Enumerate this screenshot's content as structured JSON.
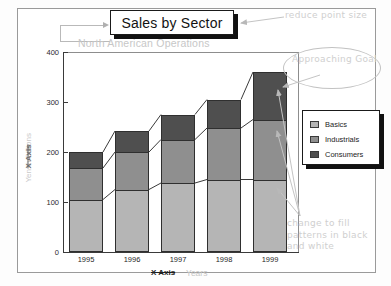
{
  "frame": {
    "name": "slide-frame"
  },
  "title": {
    "text": "Sales by Sector"
  },
  "subtitle": {
    "text": "North American Operations"
  },
  "axes": {
    "y_title_ghost": "Yen in Billions",
    "y_title_strike": "X Axis",
    "x_title_strike": "X Axis",
    "x_title_ghost": "Years"
  },
  "legend": {
    "items": [
      {
        "label": "Basics",
        "color": "#b5b5b5"
      },
      {
        "label": "Industrials",
        "color": "#8f8f8f"
      },
      {
        "label": "Consumers",
        "color": "#4f4f4f"
      }
    ]
  },
  "annotations": [
    {
      "name": "reduce-point-size",
      "text": "reduce point size"
    },
    {
      "name": "approaching-goal",
      "text": "Approaching Goal"
    },
    {
      "name": "change-fill",
      "text": "change to fill patterns in black and white"
    }
  ],
  "chart_data": {
    "type": "bar",
    "subtype": "stacked-3d-column",
    "title": "Sales by Sector",
    "subtitle": "North American Operations",
    "xlabel": "Years",
    "ylabel": "Yen in Billions",
    "categories": [
      "1995",
      "1996",
      "1997",
      "1998",
      "1999"
    ],
    "ylim": [
      0,
      400
    ],
    "yticks": [
      0,
      100,
      200,
      300,
      400
    ],
    "grid": false,
    "legend_position": "right",
    "series": [
      {
        "name": "Basics",
        "color": "#b5b5b5",
        "values": [
          105,
          125,
          138,
          145,
          145
        ]
      },
      {
        "name": "Industrials",
        "color": "#8f8f8f",
        "values": [
          63,
          75,
          87,
          103,
          120
        ]
      },
      {
        "name": "Consumers",
        "color": "#4f4f4f",
        "values": [
          32,
          42,
          50,
          57,
          95
        ]
      }
    ],
    "totals": [
      200,
      242,
      275,
      305,
      360
    ]
  }
}
